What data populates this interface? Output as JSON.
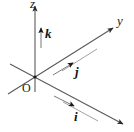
{
  "figure": {
    "type": "diagram",
    "background_color": "#ffffff",
    "line_color": "#4a4a4a",
    "label_color": "#1a1a1a",
    "width": 134,
    "height": 132
  },
  "axes": [
    {
      "name": "z-axis",
      "label": "z",
      "direction": "up (vertical)",
      "origin": [
        35,
        77
      ],
      "tip": [
        35,
        4
      ],
      "negative_end": [
        35,
        92
      ],
      "has_arrowhead": true
    },
    {
      "name": "y-axis",
      "label": "y",
      "direction": "up-right (diagonal)",
      "origin": [
        35,
        77
      ],
      "tip": [
        116,
        26
      ],
      "negative_end": [
        8,
        94
      ],
      "has_arrowhead": true
    },
    {
      "name": "x-axis",
      "label": "x",
      "direction": "down-right (toward viewer)",
      "origin": [
        35,
        77
      ],
      "tip": [
        126,
        126
      ],
      "negative_end": [
        10,
        64
      ],
      "has_arrowhead": true
    }
  ],
  "origin": {
    "label": "O",
    "position": [
      35,
      77
    ],
    "dot_radius": 1.6
  },
  "unit_vectors": [
    {
      "name": "k",
      "label": "k",
      "parallel_to": "z-axis",
      "direction": "up",
      "tail": [
        41,
        48
      ],
      "head": [
        41,
        26
      ],
      "label_position": [
        45,
        27
      ]
    },
    {
      "name": "j",
      "label": "j",
      "parallel_to": "y-axis",
      "direction": "up-right",
      "tail": [
        53,
        75
      ],
      "head": [
        75,
        61
      ],
      "label_position": [
        75,
        65
      ]
    },
    {
      "name": "i",
      "label": "i",
      "parallel_to": "x-axis",
      "direction": "down-right",
      "tail": [
        54,
        96
      ],
      "head": [
        76,
        108
      ],
      "label_position": [
        74,
        110
      ]
    }
  ],
  "guide_lines": [
    {
      "name": "y-guide-upper",
      "from": [
        62,
        71
      ],
      "to": [
        97,
        49
      ]
    },
    {
      "name": "x-guide-lower",
      "from": [
        63,
        102
      ],
      "to": [
        98,
        121
      ]
    }
  ]
}
